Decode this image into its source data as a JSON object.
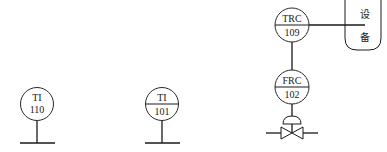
{
  "diagram": {
    "type": "instrument-symbols",
    "instruments": [
      {
        "id": "ti110",
        "tag": "TI",
        "number": "110",
        "divider": false
      },
      {
        "id": "ti101",
        "tag": "TI",
        "number": "101",
        "divider": true
      },
      {
        "id": "trc109",
        "tag": "TRC",
        "number": "109",
        "divider": true
      },
      {
        "id": "frc102",
        "tag": "FRC",
        "number": "102",
        "divider": true
      }
    ],
    "vessel": {
      "label_line1": "设",
      "label_line2": "备"
    },
    "connections": [
      {
        "from": "trc109",
        "to": "vessel"
      },
      {
        "from": "trc109",
        "to": "frc102"
      },
      {
        "from": "frc102",
        "to": "control-valve"
      }
    ],
    "colors": {
      "line": "#1a1a1a",
      "background": "#ffffff"
    }
  }
}
